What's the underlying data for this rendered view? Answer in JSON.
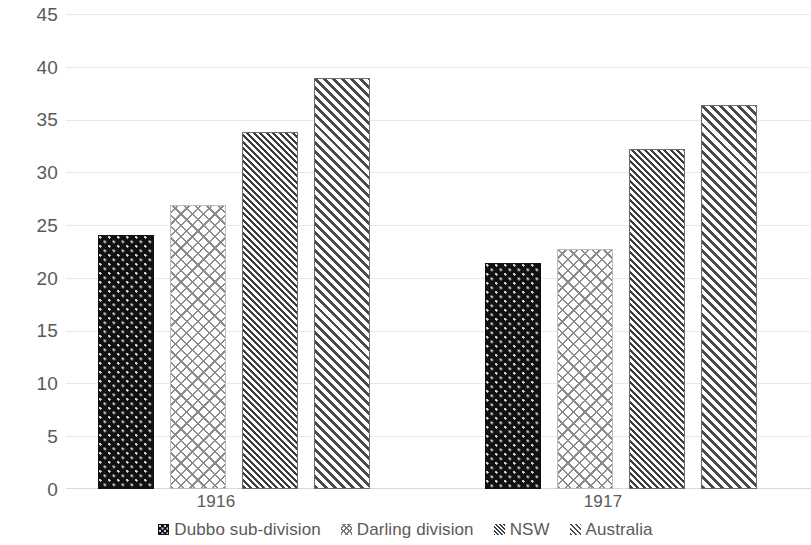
{
  "chart_data": {
    "type": "bar",
    "title": "",
    "subtitle": "",
    "xlabel": "",
    "ylabel": "",
    "categories": [
      "1916",
      "1917"
    ],
    "ylim": [
      0,
      45
    ],
    "yticks": [
      0,
      5,
      10,
      15,
      20,
      25,
      30,
      35,
      40,
      45
    ],
    "ytick_labels": [
      "0",
      "5",
      "10",
      "15",
      "20",
      "25",
      "30",
      "35",
      "40",
      "45"
    ],
    "grid": true,
    "grid_axis": "y",
    "legend_position": "bottom",
    "series": [
      {
        "name": "Dubbo sub-division",
        "pattern": "dots-on-black",
        "color": "#111111",
        "values": [
          24.1,
          21.5
        ]
      },
      {
        "name": "Darling division",
        "pattern": "cross-hatch",
        "color": "#8c8c8c",
        "values": [
          27.0,
          22.8
        ]
      },
      {
        "name": "NSW",
        "pattern": "dense-diagonal-hatch",
        "color": "#3d3d3d",
        "values": [
          33.9,
          32.3
        ]
      },
      {
        "name": "Australia",
        "pattern": "wide-diagonal-hatch",
        "color": "#4a4a4a",
        "values": [
          39.0,
          36.5
        ]
      }
    ]
  },
  "style": {
    "background": "#ffffff",
    "gridline_color": "#e9e9e9",
    "axis_color": "#d9d9d9",
    "text_color": "#5a5a5a"
  }
}
